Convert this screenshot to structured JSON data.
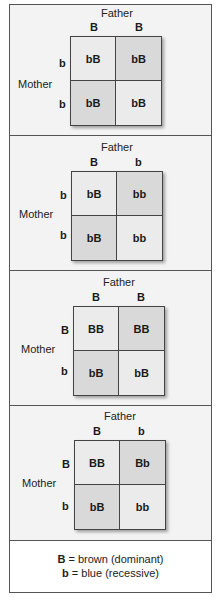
{
  "panels": [
    {
      "father_label": "Father",
      "mother_label": "Mother",
      "father_alleles": [
        "B",
        "B"
      ],
      "mother_alleles": [
        "b",
        "b"
      ],
      "cells": [
        [
          "bB",
          "bB"
        ],
        [
          "bB",
          "bB"
        ]
      ]
    },
    {
      "father_label": "Father",
      "mother_label": "Mother",
      "father_alleles": [
        "B",
        "b"
      ],
      "mother_alleles": [
        "b",
        "b"
      ],
      "cells": [
        [
          "bB",
          "bb"
        ],
        [
          "bB",
          "bb"
        ]
      ]
    },
    {
      "father_label": "Father",
      "mother_label": "Mother",
      "father_alleles": [
        "B",
        "B"
      ],
      "mother_alleles": [
        "B",
        "b"
      ],
      "cells": [
        [
          "BB",
          "BB"
        ],
        [
          "bB",
          "bB"
        ]
      ]
    },
    {
      "father_label": "Father",
      "mother_label": "Mother",
      "father_alleles": [
        "B",
        "b"
      ],
      "mother_alleles": [
        "B",
        "b"
      ],
      "cells": [
        [
          "BB",
          "Bb"
        ],
        [
          "bB",
          "bb"
        ]
      ]
    }
  ],
  "legend": {
    "dominant_symbol": "B",
    "dominant_text": " = brown (dominant)",
    "recessive_symbol": "b",
    "recessive_text": " = blue (recessive)"
  },
  "colors": {
    "border": "#555555",
    "panel_bg": "#f3f3f3",
    "cell_light": "#ebebeb",
    "cell_dark": "#d9d9d9"
  }
}
